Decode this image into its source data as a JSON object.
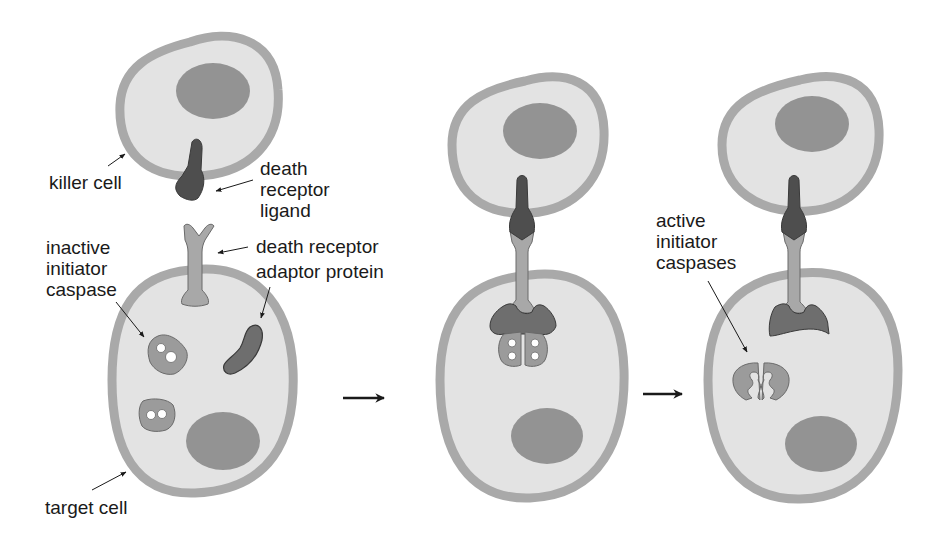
{
  "colors": {
    "background": "#ffffff",
    "cytoplasm": "#e3e3e3",
    "membrane": "#a9a9a9",
    "nucleus": "#939393",
    "ligand": "#4e4e4e",
    "receptor": "#a8a8a8",
    "adaptor": "#6e6e6e",
    "caspase": "#9b9b9b",
    "outline": "#3a3a3a",
    "text": "#1a1a1a"
  },
  "labels": {
    "killer_cell": "killer cell",
    "death_receptor_ligand": "death\nreceptor\nligand",
    "death_receptor": "death receptor",
    "adaptor_protein": "adaptor protein",
    "inactive_initiator_caspase": "inactive\ninitiator\ncaspase",
    "target_cell": "target cell",
    "active_initiator_caspases": "active\ninitiator\ncaspases"
  },
  "panels": [
    {
      "id": "panel-1",
      "stage": "separate components"
    },
    {
      "id": "panel-2",
      "stage": "ligand binds receptor, adaptor recruits caspases"
    },
    {
      "id": "panel-3",
      "stage": "caspases activated and released"
    }
  ],
  "step_arrows": 2
}
